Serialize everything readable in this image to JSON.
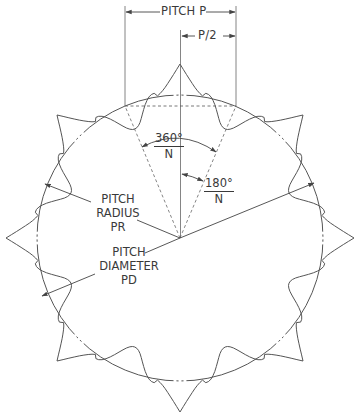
{
  "diagram": {
    "type": "sprocket-geometry",
    "tooth_count_shown": 8,
    "colors": {
      "line": "#555555",
      "text": "#3a3a3a",
      "background": "#ffffff"
    },
    "labels": {
      "pitch": "PITCH P",
      "half_pitch": "P/2",
      "pitch_angle": {
        "numerator": "360°",
        "denominator": "N"
      },
      "half_pitch_angle": {
        "numerator": "180°",
        "denominator": "N"
      },
      "pitch_radius": [
        "PITCH",
        "RADIUS",
        "PR"
      ],
      "pitch_diameter": [
        "PITCH",
        "DIAMETER",
        "PD"
      ]
    }
  }
}
